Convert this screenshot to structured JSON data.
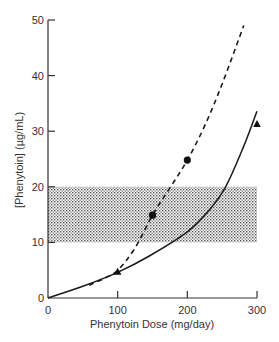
{
  "chart_data": {
    "type": "line",
    "title": "",
    "xlabel": "Phenytoin Dose (mg/day)",
    "ylabel": "[Phenytoin] (µg/mL)",
    "xlim": [
      0,
      300
    ],
    "ylim": [
      0,
      50
    ],
    "x_ticks": [
      0,
      100,
      200,
      300
    ],
    "y_ticks": [
      0,
      10,
      20,
      30,
      40,
      50
    ],
    "grid": false,
    "legend": null,
    "therapeutic_range": {
      "y_min": 10,
      "y_max": 20,
      "x_min": 0,
      "x_max": 300,
      "fill": "stippled gray"
    },
    "series": [
      {
        "name": "dashed curve",
        "style": "dashed",
        "marker": "circle",
        "curve": [
          [
            59,
            2.3
          ],
          [
            80,
            3.5
          ],
          [
            100,
            5.0
          ],
          [
            125,
            9.0
          ],
          [
            150,
            14.9
          ],
          [
            175,
            19.8
          ],
          [
            200,
            24.8
          ],
          [
            225,
            31.0
          ],
          [
            250,
            38.5
          ],
          [
            281,
            49.0
          ]
        ],
        "points": [
          [
            150,
            14.9
          ],
          [
            200,
            24.8
          ]
        ]
      },
      {
        "name": "solid curve",
        "style": "solid",
        "marker": "triangle",
        "curve": [
          [
            0,
            0
          ],
          [
            50,
            2.1
          ],
          [
            100,
            4.6
          ],
          [
            146,
            7.6
          ],
          [
            200,
            11.9
          ],
          [
            230,
            15.6
          ],
          [
            255,
            20.0
          ],
          [
            280,
            27.0
          ],
          [
            300,
            33.6
          ]
        ],
        "points": [
          [
            100,
            4.7
          ],
          [
            300,
            31.3
          ]
        ]
      }
    ]
  },
  "axes": {
    "x_tick_labels": [
      "0",
      "100",
      "200",
      "300"
    ],
    "y_tick_labels": [
      "0",
      "10",
      "20",
      "30",
      "40",
      "50"
    ]
  }
}
